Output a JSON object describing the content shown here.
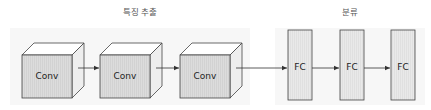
{
  "diagram": {
    "groups": [
      {
        "id": "feature-extraction",
        "label": "특징 추출"
      },
      {
        "id": "classification",
        "label": "분류"
      }
    ],
    "conv_layers": [
      {
        "label": "Conv"
      },
      {
        "label": "Conv"
      },
      {
        "label": "Conv"
      }
    ],
    "fc_layers": [
      {
        "label": "FC"
      },
      {
        "label": "FC"
      },
      {
        "label": "FC"
      }
    ],
    "colors": {
      "panel_bg": "#f7f7f7",
      "cube_front": "#d9d9d9",
      "cube_top": "#ffffff",
      "cube_side": "#eeeeee",
      "fc_fill": "#e6e6e6",
      "stroke": "#444444",
      "arrow": "#333333"
    }
  }
}
